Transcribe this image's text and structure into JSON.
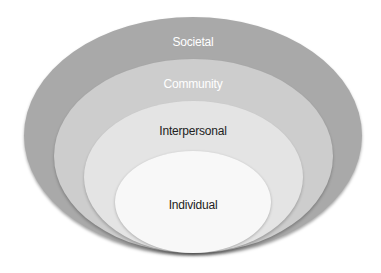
{
  "diagram": {
    "type": "nested-ellipses",
    "layers": [
      {
        "label": "Societal",
        "fill": "#a9a9a9",
        "text_color": "#ffffff"
      },
      {
        "label": "Community",
        "fill": "#cdcdcd",
        "text_color": "#ffffff"
      },
      {
        "label": "Interpersonal",
        "fill": "#e4e4e4",
        "text_color": "#222222"
      },
      {
        "label": "Individual",
        "fill": "#f8f8f8",
        "text_color": "#222222"
      }
    ]
  }
}
